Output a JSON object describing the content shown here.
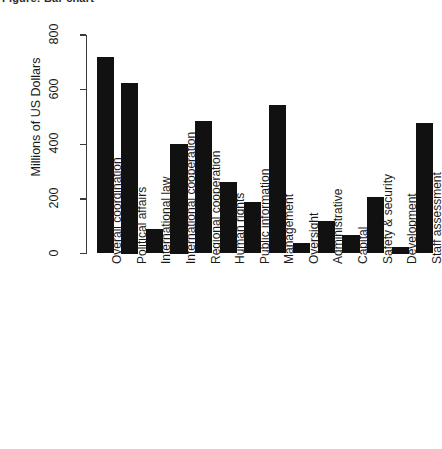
{
  "title": "Figure: Bar chart",
  "axis": {
    "ylabel": "Millions of US Dollars",
    "xlabel": "",
    "yticks": [
      "0",
      "200",
      "400",
      "600",
      "800"
    ]
  },
  "chart_data": {
    "type": "bar",
    "title": "",
    "xlabel": "",
    "ylabel": "Millions of US Dollars",
    "ylim": [
      0,
      800
    ],
    "ytick_values": [
      0,
      200,
      400,
      600,
      800
    ],
    "grid": false,
    "legend": false,
    "bar_color": "#111111",
    "categories": [
      "Overall coordination",
      "Political affairs",
      "International law",
      "International cooperation",
      "Regional cooperation",
      "Human rights",
      "Public information",
      "Management",
      "Oversight",
      "Administrative",
      "Capital",
      "Safety & security",
      "Development",
      "Staff assessment"
    ],
    "values": [
      720,
      625,
      90,
      400,
      485,
      262,
      190,
      545,
      40,
      118,
      68,
      207,
      25,
      478
    ]
  }
}
